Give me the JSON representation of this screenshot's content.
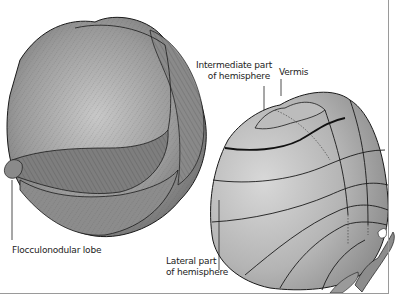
{
  "figure": {
    "left_view": {
      "description": "Cerebellum with folia, inferior/anterior view",
      "labels": {
        "flocculonodular": "Flocculonodular lobe"
      }
    },
    "right_view": {
      "description": "Schematic cerebellum with zones",
      "labels": {
        "intermediate_line1": "Intermediate part",
        "intermediate_line2": "of hemisphere",
        "vermis": "Vermis",
        "lateral_line1": "Lateral part",
        "lateral_line2": "of hemisphere"
      }
    }
  },
  "colors": {
    "tissue_light": "#c4c4c4",
    "tissue_mid": "#9c9c9c",
    "tissue_dark": "#6e6e6e",
    "outline": "#1a1a1a",
    "frame": "#9a9a9a",
    "text": "#222222"
  }
}
